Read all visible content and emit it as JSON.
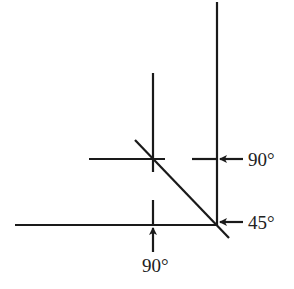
{
  "diagram": {
    "type": "angle-cut-diagram",
    "labels": {
      "right_upper": "90°",
      "right_lower": "45°",
      "bottom": "90°"
    },
    "colors": {
      "line": "#1a1a1a",
      "background": "#ffffff"
    }
  }
}
